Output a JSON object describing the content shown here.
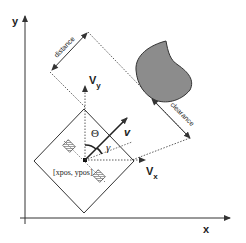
{
  "diagram": {
    "axes": {
      "x_label": "x",
      "y_label": "y"
    },
    "robot": {
      "position_label": "[xpos, ypos]"
    },
    "vectors": {
      "vx_label": "V",
      "vx_sub": "x",
      "vy_label": "V",
      "vy_sub": "y",
      "v_label": "v"
    },
    "angles": {
      "theta": "Θ",
      "gamma": "γ"
    },
    "measures": {
      "distance": "distance",
      "clearance": "clearance"
    },
    "colors": {
      "line": "#333333",
      "obstacle_fill": "#8c8c8c",
      "background": "#ffffff"
    }
  }
}
